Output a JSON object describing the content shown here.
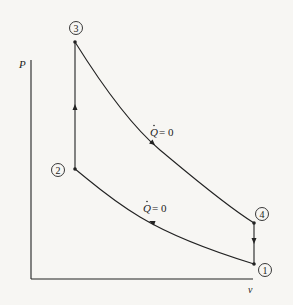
{
  "diagram": {
    "type": "P-v diagram (Otto cycle)",
    "axes": {
      "y_label": "P",
      "x_label": "v"
    },
    "states": [
      {
        "id": "1",
        "label": "1",
        "x": 254,
        "y": 264
      },
      {
        "id": "2",
        "label": "2",
        "x": 75,
        "y": 169
      },
      {
        "id": "3",
        "label": "3",
        "x": 75,
        "y": 42
      },
      {
        "id": "4",
        "label": "4",
        "x": 254,
        "y": 223
      }
    ],
    "processes": [
      {
        "from": "1",
        "to": "2",
        "kind": "isentropic compression",
        "annotation_q": "Q",
        "annotation_eq": "= 0"
      },
      {
        "from": "2",
        "to": "3",
        "kind": "constant-volume heat addition"
      },
      {
        "from": "3",
        "to": "4",
        "kind": "isentropic expansion",
        "annotation_q": "Q",
        "annotation_eq": "= 0"
      },
      {
        "from": "4",
        "to": "1",
        "kind": "constant-volume heat rejection"
      }
    ],
    "colors": {
      "background": "#f7f6f3",
      "ink": "#222222"
    }
  }
}
